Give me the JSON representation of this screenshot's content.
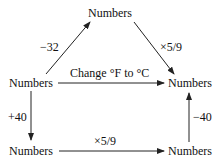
{
  "diagram": {
    "nodes": {
      "top": "Numbers",
      "left": "Numbers",
      "right": "Numbers",
      "bottom_left": "Numbers",
      "bottom_right": "Numbers"
    },
    "edges": {
      "left_to_top": "−32",
      "top_to_right": "×5/9",
      "left_to_right": "Change °F to °C",
      "left_to_bottom_left": "+40",
      "bottom_left_to_bottom_right": "×5/9",
      "bottom_right_to_right": "−40"
    }
  }
}
